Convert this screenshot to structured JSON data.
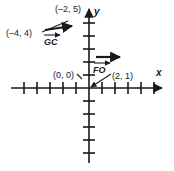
{
  "figure": {
    "background_color": "#ffffff",
    "ink_color": "#1a1a1a"
  },
  "axes": {
    "x_label": "x",
    "y_label": "y",
    "origin_px": {
      "x": 89,
      "y": 88
    },
    "unit_px": 13,
    "x_ticks_negative": 6,
    "x_ticks_positive": 5,
    "y_ticks_positive": 6,
    "y_ticks_negative": 5,
    "x_arrow": "right-arrowhead",
    "y_arrow": "up-arrowhead"
  },
  "point_labels": [
    {
      "id": "pt-neg2-5",
      "text": "(–2, 5)",
      "x_px": 55,
      "y_px": 12
    },
    {
      "id": "pt-neg4-4",
      "text": "(–4, 4)",
      "x_px": 7,
      "y_px": 35
    },
    {
      "id": "pt-origin",
      "text": "(0, 0)",
      "x_px": 54,
      "y_px": 77
    },
    {
      "id": "pt-2-1",
      "text": "(2, 1)",
      "x_px": 112,
      "y_px": 79
    }
  ],
  "vectors": [
    {
      "id": "vector-gc",
      "label": "GC",
      "label_x_px": 45,
      "label_y_px": 42,
      "notation": "overhead-arrow",
      "arrow_start": {
        "x": 45,
        "y": 30
      },
      "arrow_end": {
        "x": 75,
        "y": 26
      }
    },
    {
      "id": "vector-fo",
      "label": "FO",
      "label_x_px": 94,
      "label_y_px": 71,
      "notation": "overhead-arrow",
      "arrow_start": {
        "x": 96,
        "y": 57
      },
      "arrow_end": {
        "x": 122,
        "y": 57
      }
    }
  ],
  "leaders": [
    {
      "id": "leader-neg4-4-to-gc",
      "from": {
        "x": 43,
        "y": 31
      },
      "to": {
        "x": 70,
        "y": 21
      }
    },
    {
      "id": "leader-2-1-to-origin",
      "from": {
        "x": 110,
        "y": 74
      },
      "to": {
        "x": 90,
        "y": 89
      }
    },
    {
      "id": "leader-origin-tick",
      "from": {
        "x": 76,
        "y": 75
      },
      "to": {
        "x": 82,
        "y": 80
      }
    }
  ]
}
